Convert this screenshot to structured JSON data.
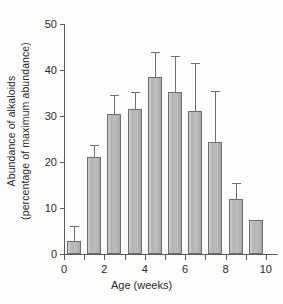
{
  "chart_data": {
    "type": "bar",
    "title": "",
    "xlabel": "Age (weeks)",
    "ylabel_line1": "Abundance of alkaloids",
    "ylabel_line2": "(percentage of maximum abundance)",
    "categories": [
      "1",
      "2",
      "3",
      "4",
      "5",
      "6",
      "7",
      "8",
      "9",
      "10"
    ],
    "values": [
      2.8,
      21.0,
      30.4,
      31.5,
      38.5,
      35.2,
      31.0,
      24.3,
      11.9,
      7.5
    ],
    "error_upper": [
      6.1,
      23.8,
      34.5,
      35.2,
      44.0,
      43.0,
      41.5,
      35.4,
      15.5,
      null
    ],
    "xlim": [
      0,
      10.6
    ],
    "ylim": [
      0,
      50
    ],
    "ytick_values": [
      0,
      10,
      20,
      30,
      40,
      50
    ],
    "ytick_labels": [
      "0",
      "10",
      "20",
      "30",
      "40",
      "50"
    ],
    "xtick_values": [
      0,
      1,
      2,
      3,
      4,
      5,
      6,
      7,
      8,
      9,
      10
    ],
    "xtick_labels": [
      "0",
      "",
      "2",
      "",
      "4",
      "",
      "6",
      "",
      "8",
      "",
      "10"
    ],
    "grid": false,
    "legend": null,
    "bar_color": "#b9b9b9",
    "bar_edge_color": "#6f6f6f",
    "axis_color": "#5a5a5a",
    "background_color": "#fdfdfb",
    "error_bar_style": "upper-only-with-cap"
  }
}
